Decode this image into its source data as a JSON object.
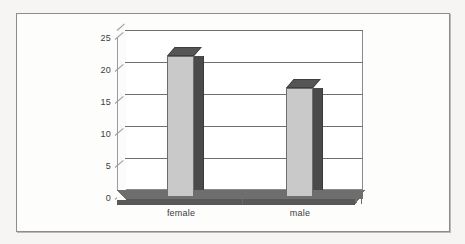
{
  "chart_data": {
    "type": "bar",
    "title": "",
    "subtitle": "",
    "xlabel": "",
    "ylabel": "",
    "categories": [
      "female",
      "male"
    ],
    "values": [
      21,
      16
    ],
    "ylim": [
      0,
      25
    ],
    "yticks": [
      0,
      5,
      10,
      15,
      20,
      25
    ],
    "ytick_labels": [
      "0",
      "5",
      "10",
      "15",
      "20",
      "25"
    ],
    "grid": true,
    "legend": false,
    "legend_position": "none",
    "style": "3d-column",
    "series": [
      {
        "name": "",
        "values": [
          21,
          16
        ]
      }
    ],
    "annotations": []
  },
  "colors": {
    "page_background": "#f6f5f3",
    "frame_background": "#fdfdfc",
    "frame_border": "#8d8d8d",
    "plot_background": "#ffffff",
    "gridline": "#6f6f6f",
    "axis_line": "#9c9c9c",
    "bar_front": "#c9c9c9",
    "bar_side": "#4a4a4a",
    "bar_top": "#555555",
    "floor_top": "#6e6e6e",
    "floor_front": "#585858",
    "text": "#3c3c3c"
  }
}
